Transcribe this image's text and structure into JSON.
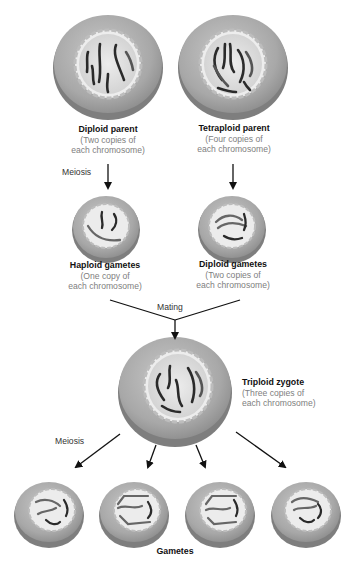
{
  "diagram": {
    "type": "flow",
    "nodes": [
      {
        "id": "diploid_parent",
        "title": "Diploid parent",
        "subtitle_line1": "(Two copies of",
        "subtitle_line2": "each chromosome)"
      },
      {
        "id": "tetraploid_parent",
        "title": "Tetraploid parent",
        "subtitle_line1": "(Four copies of",
        "subtitle_line2": "each chromosome)"
      },
      {
        "id": "haploid_gametes",
        "title": "Haploid gametes",
        "subtitle_line1": "(One copy of",
        "subtitle_line2": "each chromosome)"
      },
      {
        "id": "diploid_gametes",
        "title": "Diploid gametes",
        "subtitle_line1": "(Two copies of",
        "subtitle_line2": "each chromosome)"
      },
      {
        "id": "triploid_zygote",
        "title": "Triploid zygote",
        "subtitle_line1": "(Three copies of",
        "subtitle_line2": "each chromosome)"
      },
      {
        "id": "gametes",
        "title": "Gametes"
      }
    ],
    "edges": [
      {
        "from": "diploid_parent",
        "to": "haploid_gametes",
        "label": "Meiosis"
      },
      {
        "from": "tetraploid_parent",
        "to": "diploid_gametes",
        "label": ""
      },
      {
        "from": "haploid_gametes",
        "to": "triploid_zygote",
        "label": "Mating"
      },
      {
        "from": "diploid_gametes",
        "to": "triploid_zygote",
        "label": "Mating"
      },
      {
        "from": "triploid_zygote",
        "to": "gametes",
        "label": "Meiosis"
      }
    ],
    "colors": {
      "cell_outer": "#a9a9a9",
      "cell_rim": "#8c8c8c",
      "nucleus": "#d9d9d9",
      "chromosome": "#2a2a2a",
      "arrow": "#111111",
      "title_text": "#111111",
      "subtitle_text": "#808080"
    }
  }
}
